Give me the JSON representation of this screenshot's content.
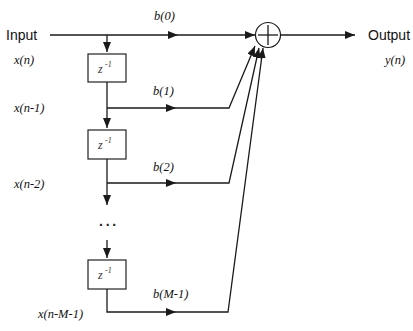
{
  "diagram": {
    "type": "FIR filter direct-form block diagram",
    "input": {
      "label": "Input",
      "signal": "x(n)"
    },
    "output": {
      "label": "Output",
      "signal": "y(n)"
    },
    "summer": {
      "symbol": "+"
    },
    "delay_blocks": [
      {
        "label": "z",
        "exponent": "-1"
      },
      {
        "label": "z",
        "exponent": "-1"
      },
      {
        "label": "z",
        "exponent": "-1"
      }
    ],
    "taps": [
      {
        "coef": "b(0)",
        "signal": "x(n)"
      },
      {
        "coef": "b(1)",
        "signal": "x(n-1)"
      },
      {
        "coef": "b(2)",
        "signal": "x(n-2)"
      },
      {
        "coef": "b(M-1)",
        "signal": "x(n-M-1)"
      }
    ],
    "ellipsis": "···"
  },
  "colors": {
    "line": "#1a1a1a",
    "box": "#222222",
    "background": "#ffffff"
  }
}
